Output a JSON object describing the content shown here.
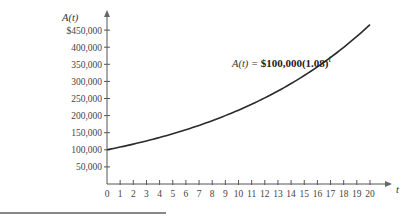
{
  "chart_data": {
    "type": "line",
    "title": "",
    "xlabel": "t",
    "ylabel": "A(t)",
    "annotation": "A(t) = $100,000(1.08)^t",
    "x_ticks": [
      0,
      1,
      2,
      3,
      4,
      5,
      6,
      7,
      8,
      9,
      10,
      11,
      12,
      13,
      14,
      15,
      16,
      17,
      18,
      19,
      20
    ],
    "y_ticks": [
      "50,000",
      "100,000",
      "150,000",
      "200,000",
      "250,000",
      "300,000",
      "350,000",
      "400,000",
      "$450,000"
    ],
    "y_tick_values": [
      50000,
      100000,
      150000,
      200000,
      250000,
      300000,
      350000,
      400000,
      450000
    ],
    "xlim": [
      0,
      21
    ],
    "ylim": [
      0,
      480000
    ],
    "grid": false,
    "legend": "none",
    "series": [
      {
        "name": "A(t)",
        "x": [
          0,
          1,
          2,
          3,
          4,
          5,
          6,
          7,
          8,
          9,
          10,
          11,
          12,
          13,
          14,
          15,
          16,
          17,
          18,
          19,
          20
        ],
        "values": [
          100000,
          108000,
          116640,
          125971,
          136049,
          146933,
          158687,
          171382,
          185093,
          199900,
          215892,
          233164,
          251817,
          271962,
          293719,
          317217,
          342594,
          370002,
          399602,
          431570,
          466096
        ]
      }
    ]
  },
  "labels": {
    "y_axis": "A(t)",
    "x_axis": "t",
    "formula_lhs": "A(t) = ",
    "formula_rhs": "$100,000(1.08)",
    "formula_exp": "t"
  }
}
